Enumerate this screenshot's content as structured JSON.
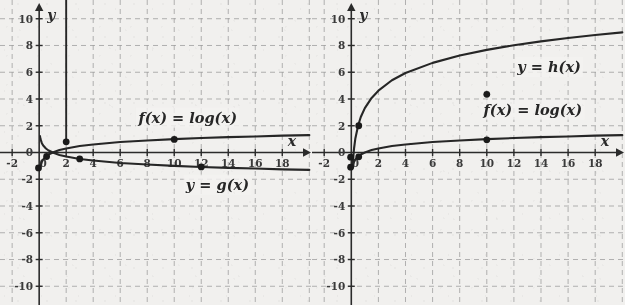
{
  "figure": {
    "background_color": "#f1f0ee",
    "grid_color": "#9a9a9a",
    "axis_color": "#2b2b2b",
    "curve_color": "#262626",
    "point_color": "#1a1a1a"
  },
  "panels": [
    {
      "id": "left",
      "axis": {
        "x_label": "x",
        "y_label": "y",
        "x_ticks": [
          "-2",
          "2",
          "4",
          "6",
          "8",
          "10",
          "12",
          "14",
          "16",
          "18"
        ],
        "x_tick_values": [
          -2,
          2,
          4,
          6,
          8,
          10,
          12,
          14,
          16,
          18
        ],
        "y_ticks": [
          "10",
          "8",
          "6",
          "4",
          "2",
          "0",
          "-2",
          "-4",
          "-6",
          "-8",
          "-10"
        ],
        "y_tick_values": [
          10,
          8,
          6,
          4,
          2,
          0,
          -2,
          -4,
          -6,
          -8,
          -10
        ],
        "origin_label": "0",
        "xlim": [
          -2.9,
          20.2
        ],
        "ylim": [
          -11.4,
          11.4
        ],
        "grid": true,
        "grid_step_x": 2,
        "grid_step_y": 2
      },
      "labels": [
        {
          "name": "f-label",
          "text": "f(x) = log(x)",
          "x": 11.0,
          "y": 2.45
        },
        {
          "name": "g-label",
          "text": "y = g(x)",
          "x": 13.2,
          "y": -2.55
        }
      ],
      "points": [
        {
          "x": -0.05,
          "y": -1.15
        },
        {
          "x": 0.55,
          "y": -0.3
        },
        {
          "x": 2.0,
          "y": 0.8
        },
        {
          "x": 3.0,
          "y": -0.48
        },
        {
          "x": 10.0,
          "y": 0.98
        },
        {
          "x": 12.0,
          "y": -1.08
        }
      ]
    },
    {
      "id": "right",
      "axis": {
        "x_label": "x",
        "y_label": "y",
        "x_ticks": [
          "-2",
          "2",
          "4",
          "6",
          "8",
          "10",
          "12",
          "14",
          "16",
          "18"
        ],
        "x_tick_values": [
          -2,
          2,
          4,
          6,
          8,
          10,
          12,
          14,
          16,
          18
        ],
        "y_ticks": [
          "10",
          "8",
          "6",
          "4",
          "2",
          "0",
          "-2",
          "-4",
          "-6",
          "-8",
          "-10"
        ],
        "y_tick_values": [
          10,
          8,
          6,
          4,
          2,
          0,
          -2,
          -4,
          -6,
          -8,
          -10
        ],
        "origin_label": "0",
        "xlim": [
          -2.9,
          20.2
        ],
        "ylim": [
          -11.4,
          11.4
        ],
        "grid": true,
        "grid_step_x": 2,
        "grid_step_y": 2
      },
      "labels": [
        {
          "name": "h-label",
          "text": "y = h(x)",
          "x": 14.6,
          "y": 6.25
        },
        {
          "name": "f-label",
          "text": "f(x) = log(x)",
          "x": 13.4,
          "y": 3.05
        }
      ],
      "points": [
        {
          "x": -0.05,
          "y": -1.1
        },
        {
          "x": -0.05,
          "y": -0.35
        },
        {
          "x": 0.55,
          "y": 2.0
        },
        {
          "x": 0.55,
          "y": -0.32
        },
        {
          "x": 10.0,
          "y": 4.35
        },
        {
          "x": 10.0,
          "y": 0.95
        }
      ]
    }
  ],
  "chart_data": {
    "type": "line",
    "title": "",
    "xlabel": "x",
    "ylabel": "y",
    "xlim": [
      -2.9,
      20.2
    ],
    "ylim": [
      -11.4,
      11.4
    ],
    "grid": true,
    "legend_position": "inline-annotations",
    "panels": [
      {
        "panel": "left",
        "x_tick_labels": [
          "-2",
          "0",
          "2",
          "4",
          "6",
          "8",
          "10",
          "12",
          "14",
          "16",
          "18"
        ],
        "y_tick_labels": [
          "-10",
          "-8",
          "-6",
          "-4",
          "-2",
          "0",
          "2",
          "4",
          "6",
          "8",
          "10"
        ],
        "series": [
          {
            "name": "f(x) = log(x)",
            "annotation": "f(x) = log(x)",
            "kind": "log",
            "formula": "y = log10(x)",
            "x": [
              0.06,
              0.1,
              0.2,
              0.3,
              0.5,
              0.7,
              1,
              1.5,
              2,
              3,
              4,
              6,
              8,
              10,
              12,
              14,
              16,
              18,
              20
            ],
            "y": [
              -1.22,
              -1.0,
              -0.7,
              -0.52,
              -0.3,
              -0.15,
              0,
              0.18,
              0.3,
              0.48,
              0.6,
              0.78,
              0.9,
              1.0,
              1.08,
              1.15,
              1.2,
              1.26,
              1.3
            ],
            "marked_points": [
              [
                -0.05,
                -1.15
              ],
              [
                0.55,
                -0.3
              ],
              [
                2.0,
                0.8
              ],
              [
                10.0,
                0.98
              ]
            ]
          },
          {
            "name": "y = g(x)",
            "annotation": "y = g(x)",
            "kind": "log-reflected",
            "formula": "y = -log10(x)",
            "x": [
              0.06,
              0.1,
              0.2,
              0.3,
              0.5,
              0.7,
              1,
              1.5,
              2,
              3,
              4,
              6,
              8,
              10,
              12,
              14,
              16,
              18,
              20
            ],
            "y": [
              1.22,
              1.0,
              0.7,
              0.52,
              0.3,
              0.15,
              0,
              -0.18,
              -0.3,
              -0.48,
              -0.6,
              -0.78,
              -0.9,
              -1.0,
              -1.08,
              -1.15,
              -1.2,
              -1.26,
              -1.3
            ],
            "marked_points": [
              [
                0.55,
                -0.3
              ],
              [
                3.0,
                -0.48
              ],
              [
                12.0,
                -1.08
              ]
            ]
          },
          {
            "name": "vertical-line",
            "annotation": "",
            "kind": "vertical",
            "formula": "x = 2",
            "x": [
              2,
              2
            ],
            "y": [
              0.8,
              11.4
            ],
            "marked_points": [
              [
                2.0,
                0.8
              ]
            ]
          }
        ]
      },
      {
        "panel": "right",
        "x_tick_labels": [
          "-2",
          "0",
          "2",
          "4",
          "6",
          "8",
          "10",
          "12",
          "14",
          "16",
          "18"
        ],
        "y_tick_labels": [
          "-10",
          "-8",
          "-6",
          "-4",
          "-2",
          "0",
          "2",
          "4",
          "6",
          "8",
          "10"
        ],
        "series": [
          {
            "name": "y = h(x)",
            "annotation": "y = h(x)",
            "kind": "log-scaled",
            "formula": "y = 4.35*log10(x) + 3.32",
            "x": [
              0.06,
              0.1,
              0.2,
              0.3,
              0.5,
              0.7,
              1,
              1.5,
              2,
              3,
              4,
              6,
              8,
              10,
              12,
              14,
              16,
              18,
              20
            ],
            "y": [
              -1.0,
              -1.0,
              0.28,
              1.05,
              2.0,
              2.65,
              3.32,
              4.08,
              4.62,
              5.4,
              5.94,
              6.7,
              7.25,
              7.67,
              8.02,
              8.31,
              8.56,
              8.78,
              8.98
            ],
            "marked_points": [
              [
                0.55,
                2.0
              ],
              [
                10.0,
                4.35
              ]
            ]
          },
          {
            "name": "f(x) = log(x)",
            "annotation": "f(x) = log(x)",
            "kind": "log",
            "formula": "y = log10(x)",
            "x": [
              0.06,
              0.1,
              0.2,
              0.3,
              0.5,
              0.7,
              1,
              1.5,
              2,
              3,
              4,
              6,
              8,
              10,
              12,
              14,
              16,
              18,
              20
            ],
            "y": [
              -1.22,
              -1.0,
              -0.7,
              -0.52,
              -0.3,
              -0.15,
              0,
              0.18,
              0.3,
              0.48,
              0.6,
              0.78,
              0.9,
              1.0,
              1.08,
              1.15,
              1.2,
              1.26,
              1.3
            ],
            "marked_points": [
              [
                -0.05,
                -1.1
              ],
              [
                0.55,
                -0.32
              ],
              [
                10.0,
                0.95
              ]
            ]
          }
        ]
      }
    ]
  }
}
